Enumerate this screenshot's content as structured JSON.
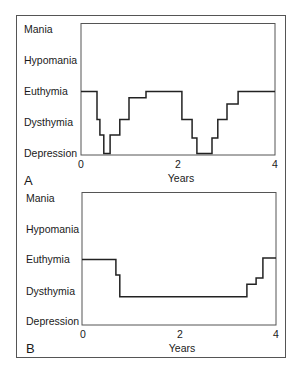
{
  "chart_data": [
    {
      "type": "line",
      "step": true,
      "panel_label": "A",
      "title": "",
      "xlabel": "Years",
      "ylabel": "",
      "x_ticks": [
        "0",
        "2",
        "4"
      ],
      "xlim": [
        0,
        4
      ],
      "y_categories": [
        "Depression",
        "Dysthymia",
        "Euthymia",
        "Hypomania",
        "Mania"
      ],
      "ylim": [
        0,
        4
      ],
      "grid": false,
      "series": [
        {
          "name": "Mood",
          "points": [
            [
              0,
              2.0
            ],
            [
              0.33,
              2.0
            ],
            [
              0.33,
              1.1
            ],
            [
              0.39,
              1.1
            ],
            [
              0.39,
              0.6
            ],
            [
              0.47,
              0.6
            ],
            [
              0.47,
              0.0
            ],
            [
              0.6,
              0.0
            ],
            [
              0.6,
              0.6
            ],
            [
              0.8,
              0.6
            ],
            [
              0.8,
              1.1
            ],
            [
              0.99,
              1.1
            ],
            [
              0.99,
              1.8
            ],
            [
              1.34,
              1.8
            ],
            [
              1.34,
              2.0
            ],
            [
              2.08,
              2.0
            ],
            [
              2.08,
              1.1
            ],
            [
              2.29,
              1.1
            ],
            [
              2.29,
              0.5
            ],
            [
              2.39,
              0.5
            ],
            [
              2.39,
              0.0
            ],
            [
              2.7,
              0.0
            ],
            [
              2.7,
              0.5
            ],
            [
              2.82,
              0.5
            ],
            [
              2.82,
              1.1
            ],
            [
              3.01,
              1.1
            ],
            [
              3.01,
              1.6
            ],
            [
              3.24,
              1.6
            ],
            [
              3.24,
              2.0
            ],
            [
              4.0,
              2.0
            ]
          ]
        }
      ]
    },
    {
      "type": "line",
      "step": true,
      "panel_label": "B",
      "title": "",
      "xlabel": "Years",
      "ylabel": "",
      "x_ticks": [
        "0",
        "2",
        "4"
      ],
      "xlim": [
        0,
        4
      ],
      "y_categories": [
        "Depression",
        "Dysthymia",
        "Euthymia",
        "Hypomania",
        "Mania"
      ],
      "ylim": [
        0,
        4
      ],
      "grid": false,
      "series": [
        {
          "name": "Mood",
          "points": [
            [
              0,
              2.0
            ],
            [
              0.7,
              2.0
            ],
            [
              0.7,
              1.5
            ],
            [
              0.78,
              1.5
            ],
            [
              0.78,
              0.8
            ],
            [
              3.4,
              0.8
            ],
            [
              3.4,
              1.2
            ],
            [
              3.59,
              1.2
            ],
            [
              3.59,
              1.4
            ],
            [
              3.73,
              1.4
            ],
            [
              3.73,
              2.05
            ],
            [
              4.0,
              2.05
            ]
          ]
        }
      ]
    }
  ],
  "panels": [
    {
      "label": "A",
      "xlabel": "Years",
      "x_ticks": [
        "0",
        "2",
        "4"
      ],
      "y_labels": [
        "Mania",
        "Hypomania",
        "Euthymia",
        "Dysthymia",
        "Depression"
      ]
    },
    {
      "label": "B",
      "xlabel": "Years",
      "x_ticks": [
        "0",
        "2",
        "4"
      ],
      "y_labels": [
        "Mania",
        "Hypomania",
        "Euthymia",
        "Dysthymia",
        "Depression"
      ]
    }
  ],
  "colors": {
    "line": "#222222",
    "frame": "#555555",
    "background": "#ffffff"
  }
}
